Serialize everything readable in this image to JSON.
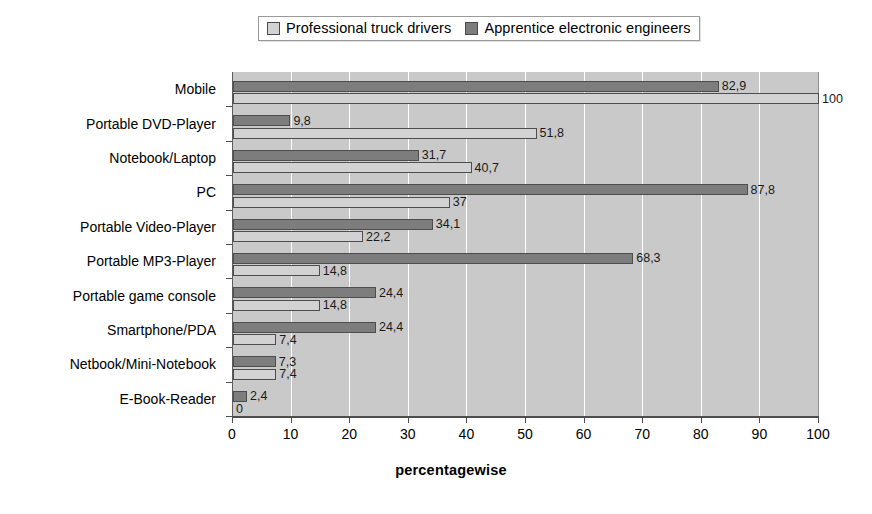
{
  "chart_data": {
    "type": "bar",
    "orientation": "horizontal",
    "title": "",
    "xlabel": "percentagewise",
    "ylabel": "",
    "xlim": [
      0,
      100
    ],
    "xticks": [
      0,
      10,
      20,
      30,
      40,
      50,
      60,
      70,
      80,
      90,
      100
    ],
    "grid": true,
    "legend_position": "top-center",
    "decimal_separator": ",",
    "categories": [
      "Mobile",
      "Portable DVD-Player",
      "Notebook/Laptop",
      "PC",
      "Portable Video-Player",
      "Portable MP3-Player",
      "Portable game console",
      "Smartphone/PDA",
      "Netbook/Mini-Notebook",
      "E-Book-Reader"
    ],
    "series": [
      {
        "name": "Professional truck drivers",
        "color": "#d2d2d2",
        "values": [
          100,
          51.8,
          40.7,
          37,
          22.2,
          14.8,
          14.8,
          7.4,
          7.4,
          0
        ],
        "labels": [
          "100",
          "51,8",
          "40,7",
          "37",
          "22,2",
          "14,8",
          "14,8",
          "7,4",
          "7,4",
          "0"
        ]
      },
      {
        "name": "Apprentice electronic engineers",
        "color": "#7d7d7d",
        "values": [
          82.9,
          9.8,
          31.7,
          87.8,
          34.1,
          68.3,
          24.4,
          24.4,
          7.3,
          2.4
        ],
        "labels": [
          "82,9",
          "9,8",
          "31,7",
          "87,8",
          "34,1",
          "68,3",
          "24,4",
          "24,4",
          "7,3",
          "2,4"
        ]
      }
    ]
  },
  "legend": {
    "items": [
      {
        "label": "Professional truck drivers",
        "color": "#d2d2d2"
      },
      {
        "label": "Apprentice electronic engineers",
        "color": "#7d7d7d"
      }
    ]
  },
  "axis": {
    "x_title": "percentagewise"
  }
}
